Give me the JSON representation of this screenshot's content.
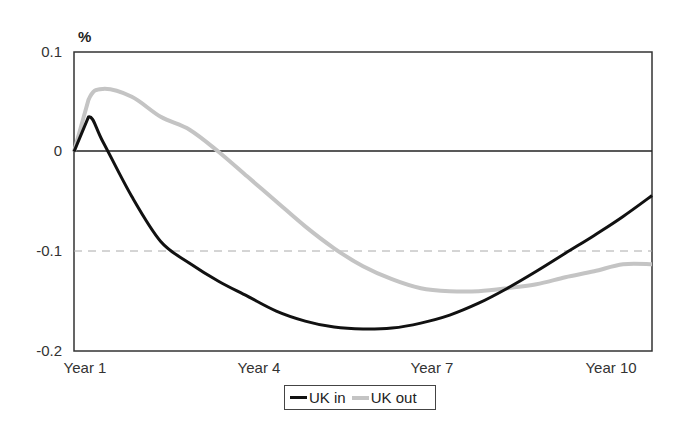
{
  "chart_data": {
    "type": "line",
    "title": "",
    "xlabel": "",
    "ylabel": "%",
    "ylim": [
      -0.2,
      0.1
    ],
    "yticks": [
      0.1,
      0,
      -0.1,
      -0.2
    ],
    "ytick_labels": [
      "0.1",
      "0",
      "-0.1",
      "-0.2"
    ],
    "xtick_labels": [
      "Year 1",
      "Year 4",
      "Year 7",
      "Year 10"
    ],
    "grid": {
      "zero_line": true,
      "dashed_reference_at": -0.1
    },
    "legend_position": "bottom-center",
    "x": [
      0,
      0.25,
      0.5,
      1,
      1.5,
      2,
      2.5,
      3,
      3.5,
      4,
      4.5,
      5,
      5.5,
      6,
      6.5,
      7,
      7.5,
      8,
      8.5,
      9,
      9.5,
      10
    ],
    "series": [
      {
        "name": "UK in",
        "color": "#111111",
        "values": [
          0.0,
          0.035,
          0.01,
          -0.045,
          -0.09,
          -0.112,
          -0.13,
          -0.145,
          -0.16,
          -0.17,
          -0.176,
          -0.178,
          -0.177,
          -0.172,
          -0.164,
          -0.152,
          -0.137,
          -0.12,
          -0.102,
          -0.084,
          -0.065,
          -0.044
        ]
      },
      {
        "name": "UK out",
        "color": "#bbbbbb",
        "values": [
          0.0,
          0.052,
          0.063,
          0.055,
          0.035,
          0.022,
          0.0,
          -0.025,
          -0.05,
          -0.075,
          -0.097,
          -0.115,
          -0.128,
          -0.137,
          -0.14,
          -0.14,
          -0.137,
          -0.133,
          -0.126,
          -0.12,
          -0.113,
          -0.113
        ]
      }
    ]
  },
  "axes": {
    "unit_label": "%",
    "y_labels": [
      "0.1",
      "0",
      "-0.1",
      "-0.2"
    ],
    "x_labels": [
      "Year 1",
      "Year 4",
      "Year 7",
      "Year 10"
    ]
  },
  "legend": {
    "items": [
      {
        "label": "UK in",
        "color": "#111111"
      },
      {
        "label": "UK out",
        "color": "#bbbbbb"
      }
    ]
  }
}
